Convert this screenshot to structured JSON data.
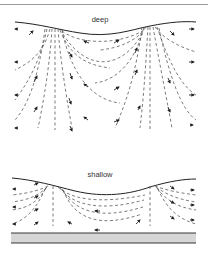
{
  "panels": [
    {
      "id": "deep",
      "label": "deep"
    },
    {
      "id": "shallow",
      "label": "shallow"
    }
  ],
  "colors": {
    "line": "#333333",
    "dash": "#444444",
    "sediment": "#bdbdbd",
    "frame": "#9a9a9a"
  }
}
